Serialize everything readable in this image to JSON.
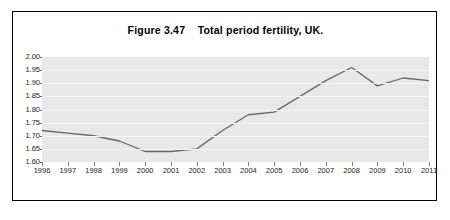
{
  "figure": {
    "title": "Figure 3.47    Total period fertility, UK.",
    "border_color": "#000000",
    "plot_background": "#e8e8e8",
    "line_color": "#666666"
  },
  "chart_data": {
    "type": "line",
    "title": "Figure 3.47    Total period fertility, UK.",
    "xlabel": "",
    "ylabel": "",
    "categories": [
      "1996",
      "1997",
      "1998",
      "1999",
      "2000",
      "2001",
      "2002",
      "2003",
      "2004",
      "2005",
      "2006",
      "2007",
      "2008",
      "2009",
      "2010",
      "2011"
    ],
    "x": [
      1996,
      1997,
      1998,
      1999,
      2000,
      2001,
      2002,
      2003,
      2004,
      2005,
      2006,
      2007,
      2008,
      2009,
      2010,
      2011
    ],
    "values": [
      1.72,
      1.71,
      1.7,
      1.68,
      1.64,
      1.64,
      1.65,
      1.72,
      1.78,
      1.79,
      1.85,
      1.91,
      1.96,
      1.89,
      1.92,
      1.91
    ],
    "ylim": [
      1.6,
      2.0
    ],
    "xlim": [
      1996,
      2011
    ],
    "ytick_labels": [
      "2.00",
      "1.95",
      "1.90",
      "1.85",
      "1.80",
      "1.75",
      "1.70",
      "1.65",
      "1.60"
    ],
    "ytick_values": [
      2.0,
      1.95,
      1.9,
      1.85,
      1.8,
      1.75,
      1.7,
      1.65,
      1.6
    ],
    "grid": true,
    "legend": null,
    "legend_position": "none",
    "series": [
      {
        "name": "Total period fertility rate",
        "values": [
          1.72,
          1.71,
          1.7,
          1.68,
          1.64,
          1.64,
          1.65,
          1.72,
          1.78,
          1.79,
          1.85,
          1.91,
          1.96,
          1.89,
          1.92,
          1.91
        ]
      }
    ]
  }
}
